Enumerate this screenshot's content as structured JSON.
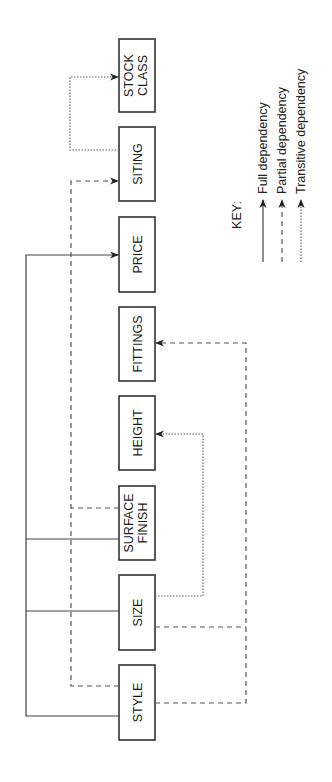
{
  "diagram": {
    "type": "functional-dependency-diagram",
    "orientation": "rotated-90-ccw",
    "entities": [
      {
        "id": "style",
        "label": [
          "STYLE"
        ]
      },
      {
        "id": "size",
        "label": [
          "SIZE"
        ]
      },
      {
        "id": "surface_finish",
        "label": [
          "SURFACE",
          "FINISH"
        ]
      },
      {
        "id": "height",
        "label": [
          "HEIGHT"
        ]
      },
      {
        "id": "fittings",
        "label": [
          "FITTINGS"
        ]
      },
      {
        "id": "price",
        "label": [
          "PRICE"
        ]
      },
      {
        "id": "siting",
        "label": [
          "SITING"
        ]
      },
      {
        "id": "stock_class",
        "label": [
          "STOCK",
          "CLASS"
        ]
      }
    ],
    "dependencies": [
      {
        "from": [
          "style",
          "size",
          "surface_finish"
        ],
        "to": "price",
        "kind": "full"
      },
      {
        "from": [
          "style",
          "surface_finish"
        ],
        "to": "siting",
        "kind": "partial"
      },
      {
        "from": [
          "style",
          "size"
        ],
        "to": "fittings",
        "kind": "partial"
      },
      {
        "from": [
          "size"
        ],
        "to": "height",
        "kind": "transitive"
      },
      {
        "from": [
          "siting"
        ],
        "to": "stock_class",
        "kind": "transitive"
      }
    ],
    "key": {
      "title": "KEY:",
      "items": [
        {
          "kind": "full",
          "label": "Full dependency"
        },
        {
          "kind": "partial",
          "label": "Partial dependency"
        },
        {
          "kind": "transitive",
          "label": "Transitive dependency"
        }
      ]
    },
    "colors": {
      "line": "#444444",
      "box_stroke": "#333333",
      "background": "#ffffff"
    }
  }
}
